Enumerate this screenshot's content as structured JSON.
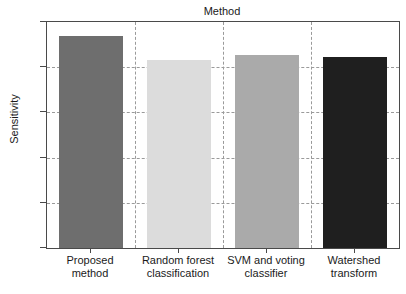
{
  "chart_data": {
    "type": "bar",
    "title": "Method",
    "xlabel": "",
    "ylabel": "Sensitivity",
    "categories": [
      "Proposed method",
      "Random forest classification",
      "SVM and voting classifier",
      "Watershed transform"
    ],
    "category_lines": [
      [
        "Proposed",
        "method"
      ],
      [
        "Random forest",
        "classification"
      ],
      [
        "SVM and voting",
        "classifier"
      ],
      [
        "Watershed",
        "transform"
      ]
    ],
    "values": [
      0.94,
      0.83,
      0.855,
      0.845
    ],
    "bar_colors": [
      "#6e6e6e",
      "#dcdcdc",
      "#aaaaaa",
      "#1f1f1f"
    ],
    "ylim": [
      0.0,
      1.0
    ],
    "ytick_labels": [
      "0.0",
      "0.2",
      "0.4",
      "0.6",
      "0.8",
      "1.0"
    ],
    "ytick_values": [
      0.0,
      0.2,
      0.4,
      0.6,
      0.8,
      1.0
    ],
    "grid": "dashed-both",
    "legend": "none",
    "axis_color": "#4a4a4a",
    "grid_color": "#9a9a9a",
    "background": "#ffffff"
  }
}
